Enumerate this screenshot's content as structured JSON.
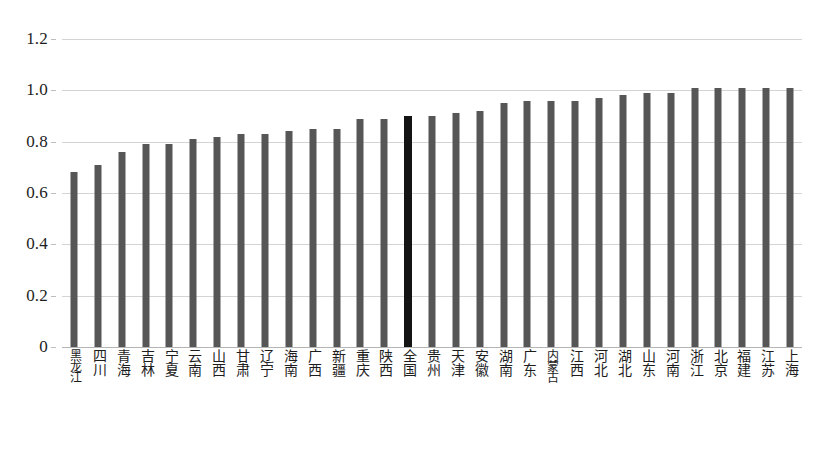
{
  "chart_data": {
    "type": "bar",
    "title": "",
    "subtitle": "",
    "xlabel": "",
    "ylabel": "",
    "ylim": [
      0,
      1.2
    ],
    "grid": true,
    "legend": null,
    "y_ticks": [
      "0",
      "0.2",
      "0.4",
      "0.6",
      "0.8",
      "1.0",
      "1.2"
    ],
    "y_tick_values": [
      0,
      0.2,
      0.4,
      0.6,
      0.8,
      1.0,
      1.2
    ],
    "highlight_category": "全国",
    "colors": {
      "bar": "#565656",
      "highlight_bar": "#141414",
      "gridline": "#d4d4d4",
      "text": "#1d1d1d",
      "background": "#ffffff"
    },
    "categories": [
      "黑龙江",
      "四川",
      "青海",
      "吉林",
      "宁夏",
      "云南",
      "山西",
      "甘肃",
      "辽宁",
      "海南",
      "广西",
      "新疆",
      "重庆",
      "陕西",
      "全国",
      "贵州",
      "天津",
      "安徽",
      "湖南",
      "广东",
      "内蒙古",
      "江西",
      "河北",
      "湖北",
      "山东",
      "河南",
      "浙江",
      "北京",
      "福建",
      "江苏",
      "上海"
    ],
    "values": [
      0.68,
      0.71,
      0.76,
      0.79,
      0.79,
      0.81,
      0.82,
      0.83,
      0.83,
      0.84,
      0.85,
      0.85,
      0.89,
      0.89,
      0.9,
      0.9,
      0.91,
      0.92,
      0.95,
      0.96,
      0.96,
      0.96,
      0.97,
      0.98,
      0.99,
      0.99,
      1.01,
      1.01,
      1.01,
      1.01,
      1.01
    ]
  }
}
